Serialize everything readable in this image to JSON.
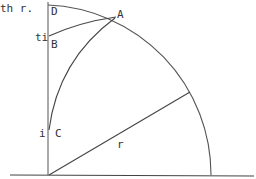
{
  "diagram": {
    "caption_fragment": "th r.",
    "points": {
      "D": "D",
      "A": "A",
      "B": "B",
      "C": "C"
    },
    "side_labels": {
      "ti": "ti",
      "i": "i",
      "r": "r"
    },
    "colors": {
      "stroke": "#444444",
      "text": "#333333",
      "background": "#ffffff"
    }
  }
}
